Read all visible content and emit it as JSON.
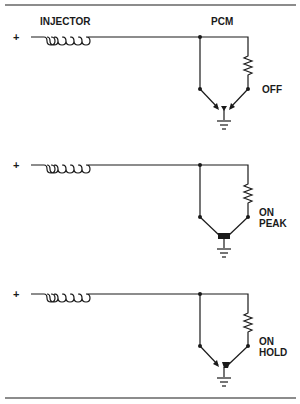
{
  "diagram": {
    "title_left": "INJECTOR",
    "title_right": "PCM",
    "circuits": [
      {
        "id": "off",
        "supply": "+",
        "state_lines": [
          "OFF"
        ],
        "transistor_state": "off"
      },
      {
        "id": "on-peak",
        "supply": "+",
        "state_lines": [
          "ON",
          "PEAK"
        ],
        "transistor_state": "on-peak"
      },
      {
        "id": "on-hold",
        "supply": "+",
        "state_lines": [
          "ON",
          "HOLD"
        ],
        "transistor_state": "on-hold"
      }
    ]
  },
  "colors": {
    "ink": "#1a1a1a",
    "background": "#ffffff"
  }
}
